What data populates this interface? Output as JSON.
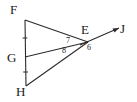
{
  "figure": {
    "background_color": "#ffffff",
    "stroke_color": "#2b2b2b",
    "label_color": "#1a1a1a",
    "width": 137,
    "height": 102,
    "points": {
      "F": {
        "label": "F",
        "x": 25,
        "y": 20
      },
      "G": {
        "label": "G",
        "x": 25,
        "y": 57
      },
      "H": {
        "label": "H",
        "x": 26,
        "y": 86
      },
      "E": {
        "label": "E",
        "x": 88,
        "y": 42
      },
      "J": {
        "label": "J",
        "x": 124,
        "y": 27
      }
    },
    "segments": [
      {
        "name": "segment-FH",
        "from": "F",
        "to": "H"
      },
      {
        "name": "segment-FE",
        "from": "F",
        "to": "E"
      },
      {
        "name": "segment-GE",
        "from": "G",
        "to": "E"
      },
      {
        "name": "segment-HE",
        "from": "H",
        "to": "E"
      }
    ],
    "rays": [
      {
        "name": "ray-EJ",
        "from": "E",
        "to": "J",
        "arrow": true
      }
    ],
    "angles": [
      {
        "name": "angle-7",
        "label": "7",
        "vertex": "E",
        "x": 66,
        "y": 37
      },
      {
        "name": "angle-8",
        "label": "8",
        "vertex": "E",
        "x": 62,
        "y": 47
      },
      {
        "name": "angle-6",
        "label": "6",
        "vertex": "E",
        "x": 87,
        "y": 44
      }
    ],
    "tick_marks": [
      {
        "name": "tick-FG",
        "on": "segment-FG"
      },
      {
        "name": "tick-GH",
        "on": "segment-GH"
      }
    ]
  }
}
